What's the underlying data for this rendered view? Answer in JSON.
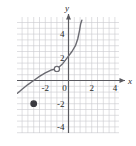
{
  "figure": {
    "kind": "coordinate-grid-graph",
    "background_color": "#ffffff",
    "grid_color": "#c9c9cf",
    "axis_color": "#5a5a60",
    "curve_color": "#6b6b72",
    "label_color": "#2b2b2b"
  },
  "axes": {
    "x_name": "x",
    "y_name": "y",
    "x_tick_labels": [
      "-2",
      "2",
      "4"
    ],
    "x_tick_values": [
      -2,
      2,
      4
    ],
    "y_tick_labels": [
      "4",
      "2",
      "-2",
      "-4"
    ],
    "y_tick_values": [
      4,
      2,
      -2,
      -4
    ],
    "origin_label": "0",
    "x_range": [
      -4.6,
      5.4
    ],
    "y_range": [
      -5.0,
      5.2
    ],
    "grid_step": 1,
    "grid_visible": true,
    "x_arrow": true,
    "y_arrow": true
  },
  "chart_data": {
    "type": "line",
    "title": "",
    "xlabel": "x",
    "ylabel": "y",
    "xlim": [
      -4.6,
      5.4
    ],
    "ylim": [
      -5.0,
      5.2
    ],
    "grid": true,
    "legend": "none",
    "series": [
      {
        "name": "curve",
        "style": "solid",
        "x": [
          -4.4,
          -4.0,
          -3.5,
          -3.0,
          -2.5,
          -2.0,
          -1.5,
          -1.0,
          -0.5,
          0.0,
          0.3,
          0.6,
          0.8,
          0.95,
          1.05,
          1.15
        ],
        "y": [
          -1.1,
          -0.75,
          -0.35,
          0.0,
          0.35,
          0.65,
          0.9,
          1.0,
          1.45,
          2.1,
          2.5,
          3.0,
          3.6,
          4.3,
          4.9,
          5.2
        ]
      }
    ],
    "points": [
      {
        "name": "open-circle-hole",
        "x": -1,
        "y": 1,
        "marker": "open-circle",
        "fill": "#ffffff",
        "stroke": "#6b6b72"
      },
      {
        "name": "filled-point",
        "x": -3,
        "y": -2,
        "marker": "filled-circle",
        "fill": "#3a3a40",
        "stroke": "#3a3a40"
      }
    ]
  }
}
